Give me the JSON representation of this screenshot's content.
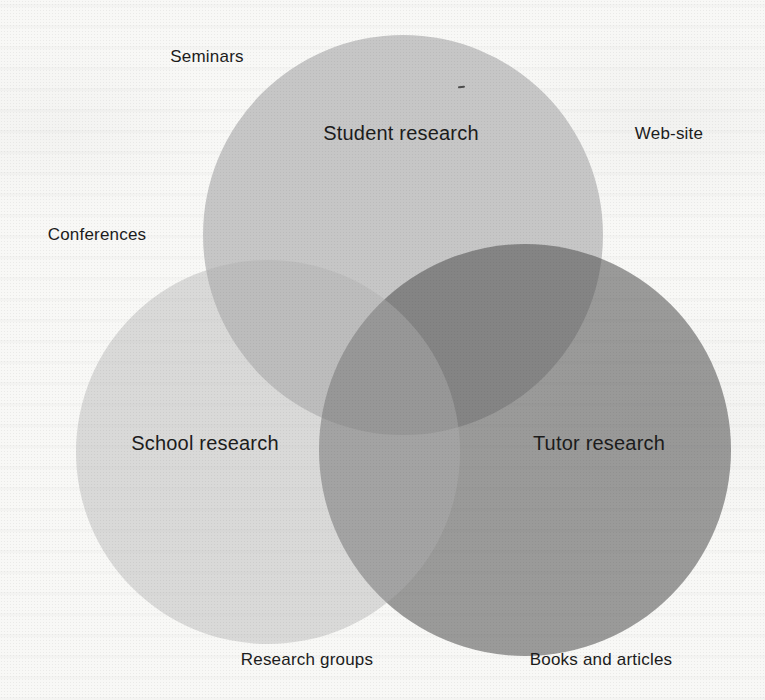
{
  "figure": {
    "type": "venn-diagram",
    "background": "#f8f8f6",
    "text_color": "#1c1c1c",
    "circles": [
      {
        "id": "student",
        "label": "Student research",
        "fill": "#c6c6c6"
      },
      {
        "id": "school",
        "label": "School research",
        "fill": "#dddddd"
      },
      {
        "id": "tutor",
        "label": "Tutor research",
        "fill": "#9d9d9d"
      }
    ],
    "outer_labels": [
      {
        "id": "seminars",
        "text": "Seminars"
      },
      {
        "id": "web-site",
        "text": "Web-site"
      },
      {
        "id": "conferences",
        "text": "Conferences"
      },
      {
        "id": "research-groups",
        "text": "Research groups"
      },
      {
        "id": "books-and-articles",
        "text": "Books and articles"
      }
    ],
    "overlap_colors": {
      "student_school": "#bcbcbc",
      "student_tutor": "#848484",
      "school_tutor": "#a5a5a5",
      "triple": "#979797"
    }
  }
}
